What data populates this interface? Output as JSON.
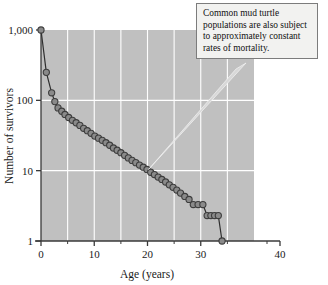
{
  "figure": {
    "background_color": "#ffffff",
    "plot_background_color": "#c0c0c0",
    "gridline_color": "#ffffff",
    "axis_color": "#3a3a3a",
    "marker_fill": "#8a8a8a",
    "marker_stroke": "#3d3d3d",
    "line_color": "#2f2f2f"
  },
  "callout": {
    "text": "Common mud turtle populations are also subject to approximately constant rates of mortality.",
    "background_color": "#f2f2f0",
    "border_color": "#7c7c7c",
    "leader_target": {
      "x": 20.2,
      "y": 10.4
    }
  },
  "chart_data": {
    "type": "line",
    "title": "",
    "subtitle": "",
    "xlabel": "Age (years)",
    "ylabel": "Number of survivors",
    "xlim": [
      0,
      40
    ],
    "ylim": [
      1,
      1000
    ],
    "yscale": "log",
    "grid": true,
    "legend": null,
    "xticks": [
      0,
      10,
      20,
      30,
      40
    ],
    "xtick_labels": [
      "0",
      "10",
      "20",
      "30",
      "40"
    ],
    "xminor_ticks": [
      5,
      15,
      25,
      35
    ],
    "yticks": [
      1,
      10,
      100,
      1000
    ],
    "ytick_labels": [
      "1",
      "10",
      "100",
      "1,000"
    ],
    "annotations": [
      "Common mud turtle populations are also subject to approximately constant rates of mortality."
    ],
    "series": [
      {
        "name": "Common mud turtle survivorship",
        "marker": "circle",
        "x": [
          0,
          1,
          2,
          2.6,
          3.2,
          3.9,
          4.5,
          5.2,
          5.9,
          6.6,
          7.3,
          8.0,
          8.7,
          9.4,
          10.1,
          10.8,
          11.5,
          12.2,
          12.9,
          13.6,
          14.3,
          15.0,
          15.7,
          16.4,
          17.1,
          17.8,
          18.5,
          19.2,
          19.9,
          20.6,
          21.3,
          22.0,
          22.7,
          23.4,
          24.1,
          24.8,
          25.5,
          26.2,
          27.0,
          27.8,
          28.6,
          29.5,
          30.4,
          31.2,
          31.9,
          32.6,
          33.3,
          34.0
        ],
        "y": [
          1000,
          250,
          128,
          96,
          78,
          70,
          63,
          57,
          52,
          48,
          44,
          40,
          37,
          34,
          31,
          29,
          27,
          25,
          23,
          21,
          19.5,
          18,
          16.5,
          15.2,
          14,
          13,
          12,
          11.2,
          10.4,
          9.5,
          8.8,
          8.1,
          7.5,
          6.9,
          6.3,
          5.8,
          5.3,
          4.8,
          4.3,
          3.9,
          3.3,
          3.3,
          3.3,
          2.3,
          2.3,
          2.3,
          2.3,
          1
        ]
      }
    ]
  }
}
